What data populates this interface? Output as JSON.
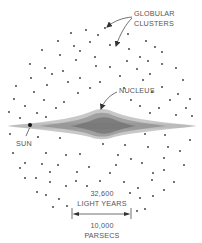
{
  "diagram": {
    "colors": {
      "background": "#ffffff",
      "ink": "#333333",
      "label": "#555555",
      "disk": "#777777"
    },
    "labels": {
      "globular_line1": "GLOBULAR",
      "globular_line2": "CLUSTERS",
      "nucleus": "NUCLEUS",
      "sun": "SUN",
      "distance_ly_value": "32,600",
      "distance_ly_unit": "LIGHT YEARS",
      "distance_pc_value": "10,000",
      "distance_pc_unit": "PARSECS"
    },
    "components": {
      "halo": "globular clusters scattered in a roughly spherical halo",
      "disk": "thin stippled galactic disk spanning x 8 to 196 px at y 126",
      "nucleus": "central bulge centered near x 100",
      "sun": "solid dot at x 30, y 125",
      "scale_bar": "dimension arrow from x 72 to x 131 at y 214"
    }
  }
}
